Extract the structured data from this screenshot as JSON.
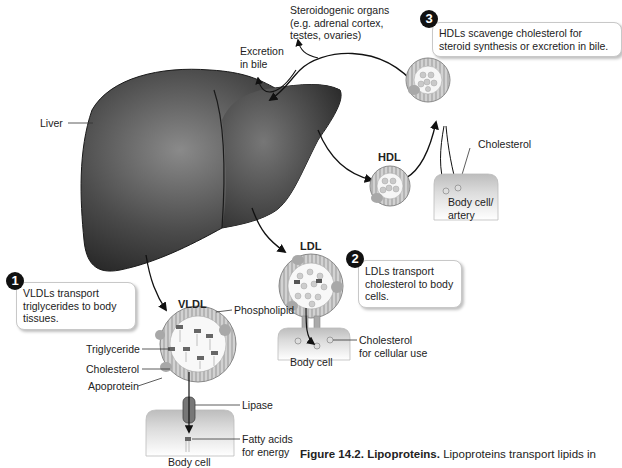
{
  "diagram": {
    "organs": {
      "liver": "Liver",
      "steroidogenic": [
        "Steroidogenic organs",
        "(e.g. adrenal cortex,",
        "testes, ovaries)"
      ],
      "excretion": [
        "Excretion",
        "in bile"
      ]
    },
    "particles": {
      "vldl": "VLDL",
      "ldl": "LDL",
      "hdl": "HDL"
    },
    "component_labels": {
      "phospholipid": "Phospholipid",
      "triglyceride": "Triglyceride",
      "cholesterol": "Cholesterol",
      "apoprotein": "Apoprotein",
      "lipase": "Lipase",
      "fatty_acids": [
        "Fatty acids",
        "for energy"
      ],
      "cholesterol_cellular": [
        "Cholesterol",
        "for cellular use"
      ],
      "cholesterol_hdl": "Cholesterol"
    },
    "cells": {
      "vldl_cell": "Body cell",
      "ldl_cell": "Body cell",
      "hdl_cell": [
        "Body cell/",
        "artery"
      ]
    },
    "steps": [
      {
        "number": "1",
        "text": [
          "VLDLs transport",
          "triglycerides to body",
          "tissues."
        ]
      },
      {
        "number": "2",
        "text": [
          "LDLs transport",
          "cholesterol to body",
          "cells."
        ]
      },
      {
        "number": "3",
        "text": [
          "HDLs scavenge cholesterol for",
          "steroid synthesis or excretion in bile."
        ]
      }
    ]
  },
  "caption": {
    "label": "Figure 14.2.",
    "title": "Lipoproteins.",
    "text": "Lipoproteins transport lipids in"
  },
  "colors": {
    "liver_dark": "#2b2b2b",
    "liver_light": "#8a8a8a",
    "particle_shell": "#9a9a9a",
    "cell_fill": "#d4d4d4",
    "badge": "#111111"
  }
}
